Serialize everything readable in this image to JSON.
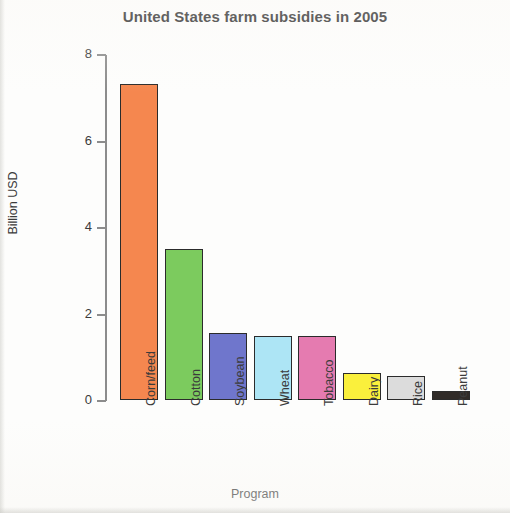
{
  "chart_data": {
    "type": "bar",
    "title": "United States farm subsidies in 2005",
    "xlabel": "Program",
    "ylabel": "Billion USD",
    "categories": [
      "Corn/feed",
      "Cotton",
      "Soybean",
      "Wheat",
      "Tobacco",
      "Dairy",
      "Rice",
      "Peanut"
    ],
    "values": [
      7.3,
      3.5,
      1.55,
      1.48,
      1.47,
      0.62,
      0.56,
      0.2
    ],
    "bar_colors": [
      "#F5874F",
      "#7CCB5E",
      "#6F76CC",
      "#ADE5F5",
      "#E57BB0",
      "#FAF03C",
      "#DCDCDC",
      "#302B28"
    ],
    "bar_edge_color": "#2B2B2B",
    "ylim": [
      0,
      8
    ],
    "yticks": [
      0,
      2,
      4,
      6,
      8
    ],
    "ytick_labels": [
      "0",
      "2",
      "4",
      "6",
      "8"
    ],
    "grid": false,
    "legend": false,
    "xtick_rotation": -90,
    "axis_color": "#8C8C8C",
    "series": [
      {
        "name": "Farm subsidies 2005",
        "points": [
          {
            "category": "Corn/feed",
            "value": 7.3,
            "color": "#F5874F"
          },
          {
            "category": "Cotton",
            "value": 3.5,
            "color": "#7CCB5E"
          },
          {
            "category": "Soybean",
            "value": 1.55,
            "color": "#6F76CC"
          },
          {
            "category": "Wheat",
            "value": 1.48,
            "color": "#ADE5F5"
          },
          {
            "category": "Tobacco",
            "value": 1.47,
            "color": "#E57BB0"
          },
          {
            "category": "Dairy",
            "value": 0.62,
            "color": "#FAF03C"
          },
          {
            "category": "Rice",
            "value": 0.56,
            "color": "#DCDCDC"
          },
          {
            "category": "Peanut",
            "value": 0.2,
            "color": "#302B28"
          }
        ]
      }
    ]
  }
}
